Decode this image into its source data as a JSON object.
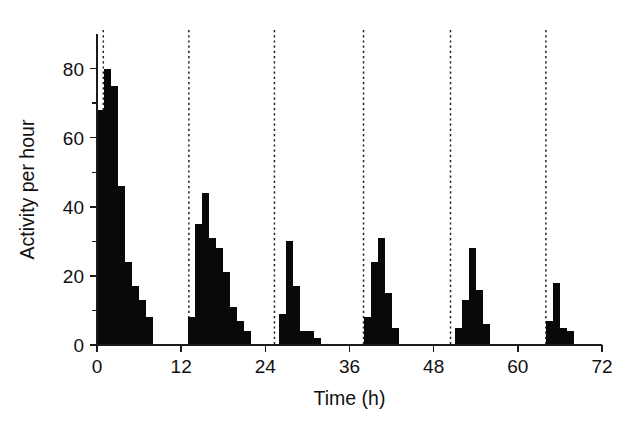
{
  "chart_data": {
    "type": "bar",
    "title": "",
    "subtitle": "",
    "xlabel": "Time (h)",
    "ylabel": "Activity per hour",
    "xlim": [
      0,
      72
    ],
    "ylim": [
      0,
      90
    ],
    "xticks": [
      0,
      12,
      24,
      36,
      48,
      60,
      72
    ],
    "xtick_labels": [
      "0",
      "12",
      "24",
      "36",
      "48",
      "60",
      "72"
    ],
    "yticks": [
      0,
      20,
      40,
      60,
      80
    ],
    "ytick_labels": [
      "0",
      "20",
      "40",
      "60",
      "80"
    ],
    "y_minor_ticks": [
      10,
      30,
      50,
      70
    ],
    "grid": false,
    "legend": null,
    "bar_width_hours": 1,
    "bar_color": "#090909",
    "annotations": {
      "marker_lines_label": "dashed vertical onset markers",
      "marker_line_color": "#20201f",
      "marker_line_style": "dashed",
      "marker_line_hours": [
        0.9,
        13.1,
        25.3,
        38.0,
        50.4,
        64.0
      ]
    },
    "x": [
      0,
      1,
      2,
      3,
      4,
      5,
      6,
      7,
      8,
      9,
      10,
      11,
      12,
      13,
      14,
      15,
      16,
      17,
      18,
      19,
      20,
      21,
      22,
      23,
      24,
      25,
      26,
      27,
      28,
      29,
      30,
      31,
      32,
      33,
      34,
      35,
      36,
      37,
      38,
      39,
      40,
      41,
      42,
      43,
      44,
      45,
      46,
      47,
      48,
      49,
      50,
      51,
      52,
      53,
      54,
      55,
      56,
      57,
      58,
      59,
      60,
      61,
      62,
      63,
      64,
      65,
      66,
      67,
      68,
      69,
      70,
      71
    ],
    "values": [
      68,
      80,
      75,
      46,
      24,
      17,
      13,
      8,
      0,
      0,
      0,
      0,
      0,
      8,
      35,
      44,
      31,
      28,
      21,
      11,
      7,
      4,
      0,
      0,
      0,
      0,
      9,
      30,
      17,
      4,
      4,
      2,
      0,
      0,
      0,
      0,
      0,
      0,
      8,
      24,
      31,
      15,
      5,
      0,
      0,
      0,
      0,
      0,
      0,
      0,
      0,
      5,
      13,
      28,
      16,
      6,
      0,
      0,
      0,
      0,
      0,
      0,
      0,
      0,
      7,
      18,
      5,
      4,
      0,
      0,
      0,
      0
    ],
    "series": [
      {
        "name": "Activity per hour",
        "values": [
          68,
          80,
          75,
          46,
          24,
          17,
          13,
          8,
          0,
          0,
          0,
          0,
          0,
          8,
          35,
          44,
          31,
          28,
          21,
          11,
          7,
          4,
          0,
          0,
          0,
          0,
          9,
          30,
          17,
          4,
          4,
          2,
          0,
          0,
          0,
          0,
          0,
          0,
          8,
          24,
          31,
          15,
          5,
          0,
          0,
          0,
          0,
          0,
          0,
          0,
          0,
          5,
          13,
          28,
          16,
          6,
          0,
          0,
          0,
          0,
          0,
          0,
          0,
          0,
          7,
          18,
          5,
          4,
          0,
          0,
          0,
          0
        ]
      }
    ]
  },
  "figure": {
    "background_color": "#ffffff"
  }
}
